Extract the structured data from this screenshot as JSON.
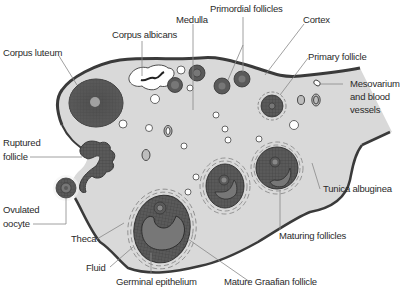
{
  "diagram": {
    "colors": {
      "background": "#ffffff",
      "stroma": "#d9d9d9",
      "tunica_outline": "#3a3a3a",
      "follicle_dark": "#555555",
      "antrum": "#777777",
      "leader_line": "#888888",
      "label_text": "#2a2a2a"
    },
    "labels": {
      "corpus_luteum": "Corpus luteum",
      "corpus_albicans": "Corpus albicans",
      "medulla": "Medulla",
      "primordial_follicles": "Primordial follicles",
      "cortex": "Cortex",
      "primary_follicle": "Primary follicle",
      "mesovarium_line1": "Mesovarium",
      "mesovarium_line2": "and blood",
      "mesovarium_line3": "vessels",
      "ruptured_line1": "Ruptured",
      "ruptured_line2": "follicle",
      "ovulated_line1": "Ovulated",
      "ovulated_line2": "oocyte",
      "tunica_albuginea": "Tunica albuginea",
      "maturing_follicles": "Maturing follicles",
      "theca": "Theca",
      "fluid": "Fluid",
      "germinal_epithelium": "Germinal epithelium",
      "mature_graafian_follicle": "Mature Graafian follicle"
    }
  }
}
